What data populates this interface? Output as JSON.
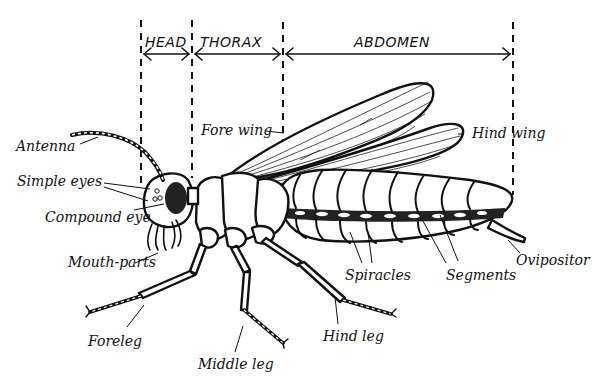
{
  "diagram": {
    "sections": [
      {
        "id": "head",
        "label": "HEAD"
      },
      {
        "id": "thorax",
        "label": "THORAX"
      },
      {
        "id": "abdomen",
        "label": "ABDOMEN"
      }
    ],
    "labels": {
      "antenna": "Antenna",
      "simple_eyes": "Simple eyes",
      "compound_eye": "Compound eye",
      "mouth_parts": "Mouth-parts",
      "fore_wing": "Fore wing",
      "hind_wing": "Hind wing",
      "spiracles": "Spiracles",
      "segments": "Segments",
      "ovipositor": "Ovipositor",
      "foreleg": "Foreleg",
      "middle_leg": "Middle leg",
      "hind_leg": "Hind leg"
    },
    "colors": {
      "ink": "#111111",
      "background": "#ffffff"
    }
  }
}
